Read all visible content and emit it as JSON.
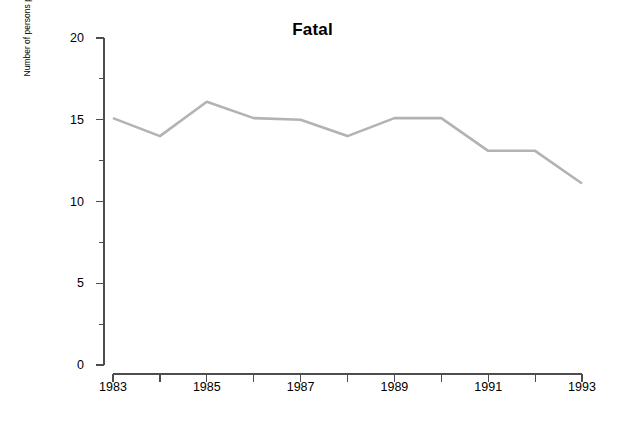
{
  "chart_data": {
    "type": "line",
    "title": "Fatal",
    "xlabel": "",
    "ylabel": "Number of persons per million population",
    "x": [
      1983,
      1984,
      1985,
      1986,
      1987,
      1988,
      1989,
      1990,
      1991,
      1992,
      1993
    ],
    "values": [
      15.1,
      14.0,
      16.1,
      15.1,
      15.0,
      14.0,
      15.1,
      15.1,
      13.1,
      13.1,
      11.1
    ],
    "series": [
      {
        "name": "Fatal",
        "values": [
          15.1,
          14.0,
          16.1,
          15.1,
          15.0,
          14.0,
          15.1,
          15.1,
          13.1,
          13.1,
          11.1
        ]
      }
    ],
    "xlim": [
      1983,
      1993
    ],
    "ylim": [
      0,
      20
    ],
    "y_ticks": [
      0,
      5,
      10,
      15,
      20
    ],
    "y_minor_ticks": [
      2.5,
      7.5,
      12.5,
      17.5
    ],
    "y_tick_labels": [
      "0",
      "5",
      "10",
      "15",
      "20"
    ],
    "x_ticks": [
      1983,
      1984,
      1985,
      1986,
      1987,
      1988,
      1989,
      1990,
      1991,
      1992,
      1993
    ],
    "x_tick_labels": [
      "1983",
      "",
      "1985",
      "",
      "1987",
      "",
      "1989",
      "",
      "1991",
      "",
      "1993"
    ],
    "x_labeled_ticks": [
      {
        "value": 1983,
        "label": "1983"
      },
      {
        "value": 1985,
        "label": "1985"
      },
      {
        "value": 1987,
        "label": "1987"
      },
      {
        "value": 1989,
        "label": "1989"
      },
      {
        "value": 1991,
        "label": "1991"
      },
      {
        "value": 1993,
        "label": "1993"
      }
    ],
    "grid": false,
    "legend": false,
    "line_color": "#b3b3b3",
    "axis_color": "#4d4d4d",
    "background_color": "#ffffff",
    "line_width": 2.6
  }
}
